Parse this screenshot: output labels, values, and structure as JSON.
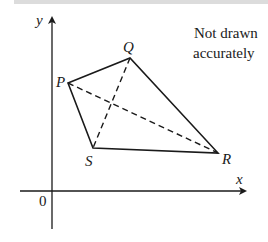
{
  "diagram": {
    "note_line1": "Not drawn",
    "note_line2": "accurately",
    "axes": {
      "x_label": "x",
      "y_label": "y",
      "origin_label": "0"
    },
    "vertices": {
      "P": {
        "label": "P",
        "x": 68,
        "y": 83
      },
      "Q": {
        "label": "Q",
        "x": 130,
        "y": 58
      },
      "R": {
        "label": "R",
        "x": 218,
        "y": 153
      },
      "S": {
        "label": "S",
        "x": 93,
        "y": 148
      }
    },
    "edges": [
      "PQ",
      "QR",
      "RS",
      "SP"
    ],
    "diagonals_dashed": [
      "PR",
      "QS"
    ],
    "colors": {
      "line": "#1a1a1a",
      "top_band": "#dcdcdc"
    }
  }
}
